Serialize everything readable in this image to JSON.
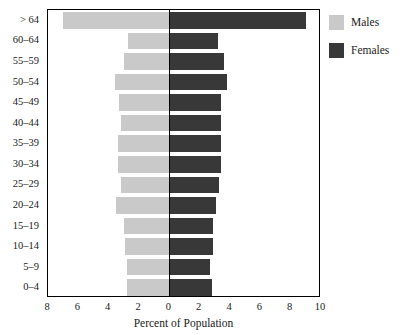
{
  "chart_data": {
    "type": "bar",
    "subtype": "population-pyramid",
    "title": "",
    "xlabel": "Percent of Population",
    "ylabel": "",
    "categories": [
      "> 64",
      "60–64",
      "55–59",
      "50–54",
      "45–49",
      "40–44",
      "35–39",
      "30–34",
      "25–29",
      "20–24",
      "15–19",
      "10–14",
      "5–9",
      "0–4"
    ],
    "series": [
      {
        "name": "Males",
        "side": "left",
        "color": "#c9c9c9",
        "values": [
          7.0,
          2.7,
          3.0,
          3.6,
          3.3,
          3.2,
          3.4,
          3.4,
          3.2,
          3.5,
          3.0,
          2.9,
          2.8,
          2.8
        ]
      },
      {
        "name": "Females",
        "side": "right",
        "color": "#383838",
        "values": [
          9.0,
          3.2,
          3.6,
          3.8,
          3.4,
          3.4,
          3.4,
          3.4,
          3.3,
          3.1,
          2.9,
          2.9,
          2.7,
          2.8
        ]
      }
    ],
    "x_ticks": [
      {
        "label": "8",
        "value": -8
      },
      {
        "label": "6",
        "value": -6
      },
      {
        "label": "4",
        "value": -4
      },
      {
        "label": "2",
        "value": -2
      },
      {
        "label": "0",
        "value": 0
      },
      {
        "label": "2",
        "value": 2
      },
      {
        "label": "4",
        "value": 4
      },
      {
        "label": "6",
        "value": 6
      },
      {
        "label": "8",
        "value": 8
      },
      {
        "label": "10",
        "value": 10
      }
    ],
    "xlim": [
      -8,
      10
    ],
    "grid": false,
    "legend_position": "right"
  },
  "legend": {
    "items": [
      {
        "label": "Males",
        "color": "#c9c9c9",
        "swatch_name": "legend-swatch-males"
      },
      {
        "label": "Females",
        "color": "#383838",
        "swatch_name": "legend-swatch-females"
      }
    ]
  },
  "axis": {
    "x_title": "Percent of Population"
  }
}
